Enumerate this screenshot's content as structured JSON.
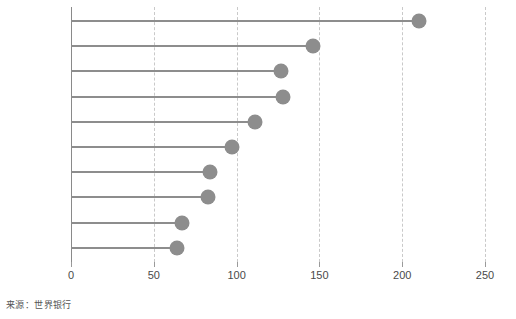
{
  "chart_data": {
    "type": "bar",
    "subtype": "lollipop-horizontal",
    "title": "",
    "subtitle": "",
    "xlabel": "",
    "ylabel": "",
    "orientation": "horizontal",
    "grid": true,
    "grid_style": "dashed-vertical",
    "legend": false,
    "legend_position": "none",
    "xlim": [
      0,
      250
    ],
    "xticks": [
      0,
      50,
      100,
      150,
      200,
      250
    ],
    "xtick_labels": [
      "0",
      "50",
      "100",
      "150",
      "200",
      "250"
    ],
    "categories": [
      "巴西",
      "俄罗斯",
      "日本",
      "墨西哥",
      "埃塞俄比亚",
      "越南",
      "德国",
      "土耳其",
      "法国",
      "意大利"
    ],
    "values": [
      210,
      146,
      127,
      128,
      111,
      97,
      84,
      83,
      67,
      64
    ],
    "marker_color": "#8d8d8d",
    "stem_color": "#8d8d8d",
    "axis_color": "#8a8a8a",
    "grid_color": "#c9c9c9"
  },
  "footer": {
    "source_note": "来源：世界银行"
  }
}
